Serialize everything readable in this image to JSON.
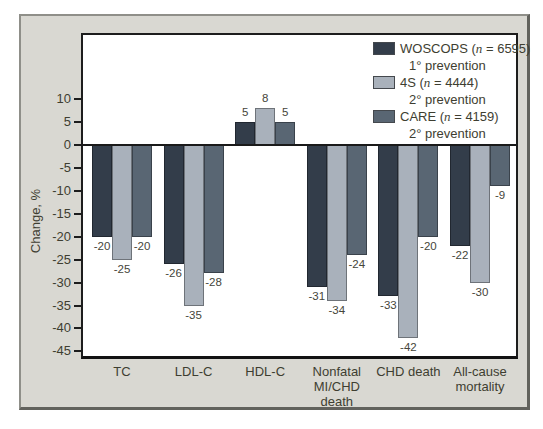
{
  "figure": {
    "ylabel": "Change, %",
    "colors": {
      "page_bg": "#ffffff",
      "panel_bg": "#d9d8d2",
      "plot_bg": "#ffffff",
      "axis": "#1d1d1d",
      "text": "#3e3e31",
      "woscops": "#333d4a",
      "fourS": "#a9b1bb",
      "care": "#596673"
    }
  },
  "legend": {
    "entries": [
      {
        "name_prefix": "WOSCOPS (",
        "n": "n",
        "name_suffix": " = 6595)",
        "prevention": "1° prevention"
      },
      {
        "name_prefix": "4S (",
        "n": "n",
        "name_suffix": " = 4444)",
        "prevention": "2° prevention"
      },
      {
        "name_prefix": "CARE (",
        "n": "n",
        "name_suffix": " = 4159)",
        "prevention": "2° prevention"
      }
    ]
  },
  "chart_data": {
    "type": "bar",
    "title": "",
    "xlabel": "",
    "ylabel": "Change, %",
    "categories": [
      "TC",
      "LDL-C",
      "HDL-C",
      "Nonfatal\nMI/CHD\ndeath",
      "CHD death",
      "All-cause\nmortality"
    ],
    "series": [
      {
        "name": "WOSCOPS (n = 6595) 1° prevention",
        "short": "WOSCOPS",
        "color": "#333d4a",
        "values": [
          -20,
          -26,
          5,
          -31,
          -33,
          -22
        ]
      },
      {
        "name": "4S (n = 4444) 2° prevention",
        "short": "4S",
        "color": "#a9b1bb",
        "values": [
          -25,
          -35,
          8,
          -34,
          -42,
          -30
        ]
      },
      {
        "name": "CARE (n = 4159) 2° prevention",
        "short": "CARE",
        "color": "#596673",
        "values": [
          -20,
          -28,
          5,
          -24,
          -20,
          -9
        ]
      }
    ],
    "yticks": [
      10,
      5,
      0,
      -5,
      -10,
      -15,
      -20,
      -25,
      -30,
      -35,
      -40,
      -45
    ],
    "ylim": [
      -46,
      24
    ],
    "grid": false,
    "legend_position": "top-right",
    "bar_value_labels": true
  }
}
